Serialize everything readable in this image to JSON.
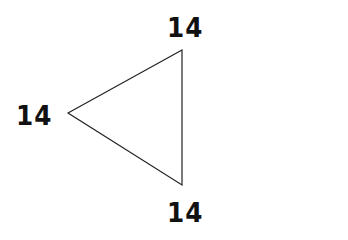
{
  "diagram": {
    "shape": "triangle",
    "stroke_color": "#222222",
    "fill_color": "none",
    "vertices": {
      "top": {
        "x": 182,
        "y": 50
      },
      "left": {
        "x": 68,
        "y": 113
      },
      "bottom": {
        "x": 182,
        "y": 185
      }
    },
    "labels": {
      "top": "14",
      "left": "14",
      "bottom": "14"
    }
  }
}
